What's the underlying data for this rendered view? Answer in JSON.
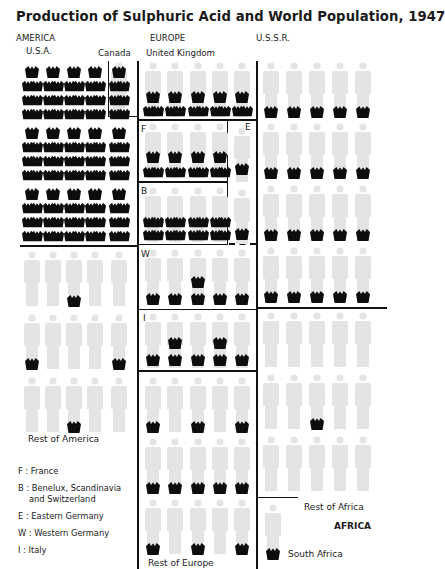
{
  "title": "Production of Sulphuric Acid and World Population, 1947",
  "regions": {
    "america": "AMERICA",
    "europe": "EUROPE",
    "ussr": "U.S.S.R.",
    "africa": "AFRICA"
  },
  "sublabels": {
    "usa": "U.S.A.",
    "canada": "Canada",
    "uk": "United Kingdom",
    "rest_america": "Rest of America",
    "rest_europe": "Rest of Europe",
    "rest_africa": "Rest of Africa",
    "south_africa": "South Africa"
  },
  "block_marks": {
    "F": "F",
    "E": "E",
    "B": "B",
    "W": "W",
    "I": "I"
  },
  "legend": [
    {
      "key": "F",
      "sep": ":",
      "text": "France"
    },
    {
      "key": "B",
      "sep": ":",
      "text": "Benelux, Scandinavia",
      "text2": "and Switzerland"
    },
    {
      "key": "E",
      "sep": ":",
      "text": "Eastern Germany"
    },
    {
      "key": "W",
      "sep": ":",
      "text": "Western Germany"
    },
    {
      "key": "I",
      "sep": ":",
      "text": "Italy"
    }
  ],
  "colors": {
    "figure": "#e4e4e4",
    "acid": "#0d0d0d",
    "line": "#111111",
    "background": "#ffffff"
  },
  "chart_data": {
    "type": "isotype",
    "title": "Production of Sulphuric Acid and World Population, 1947",
    "legend_symbols": [
      {
        "symbol": "light person figure",
        "meaning": "population unit"
      },
      {
        "symbol": "dark acid vessel",
        "meaning": "sulphuric acid production unit"
      }
    ],
    "groups": [
      {
        "region": "AMERICA",
        "area": "U.S.A.",
        "population_figures": 15,
        "acid_symbols": 105
      },
      {
        "region": "AMERICA",
        "area": "Canada",
        "population_figures": 1,
        "acid_symbols": 6
      },
      {
        "region": "AMERICA",
        "area": "Rest of America",
        "population_figures": 15,
        "acid_symbols": 4
      },
      {
        "region": "EUROPE",
        "area": "United Kingdom",
        "population_figures": 5,
        "acid_symbols": 15
      },
      {
        "region": "EUROPE",
        "area": "France (F)",
        "population_figures": 4,
        "acid_symbols": 12
      },
      {
        "region": "EUROPE",
        "area": "Eastern Germany (E)",
        "population_figures": 2,
        "acid_symbols": 2
      },
      {
        "region": "EUROPE",
        "area": "Benelux, Scandinavia and Switzerland (B)",
        "population_figures": 4,
        "acid_symbols": 16
      },
      {
        "region": "EUROPE",
        "area": "Western Germany (W)",
        "population_figures": 5,
        "acid_symbols": 6
      },
      {
        "region": "EUROPE",
        "area": "Italy (I)",
        "population_figures": 5,
        "acid_symbols": 7
      },
      {
        "region": "EUROPE",
        "area": "Rest of Europe",
        "population_figures": 15,
        "acid_symbols": 11
      },
      {
        "region": "U.S.S.R.",
        "area": "U.S.S.R.",
        "population_figures": 20,
        "acid_symbols": 20
      },
      {
        "region": "AFRICA",
        "area": "Rest of Africa",
        "population_figures": 15,
        "acid_symbols": 1
      },
      {
        "region": "AFRICA",
        "area": "South Africa",
        "population_figures": 1,
        "acid_symbols": 1
      }
    ]
  }
}
